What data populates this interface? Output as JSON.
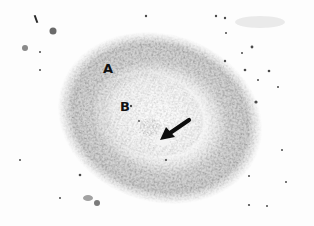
{
  "figure": {
    "labels": [
      {
        "id": "A",
        "text": "A",
        "meaning": "outer dense ring zone"
      },
      {
        "id": "B",
        "text": "B",
        "meaning": "inner lighter zone"
      }
    ],
    "arrow": {
      "points_to": "central structure",
      "tail": [
        189,
        120
      ],
      "head": [
        161,
        140
      ]
    },
    "colors": {
      "background": "#fdfdfd",
      "ring": "#8a8a8a",
      "inner": "#d6d6d6",
      "label": "#111111",
      "arrow": "#0d0d0d"
    }
  }
}
